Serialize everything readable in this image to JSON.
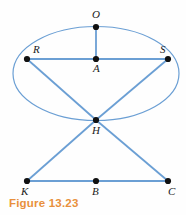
{
  "figure": {
    "caption": "Figure 13.23",
    "caption_color": "#e8903c",
    "stroke_color": "#6b9fd4",
    "point_color": "#111111",
    "background": "#fefefe",
    "width": 186,
    "height": 215
  },
  "points": [
    {
      "id": "O",
      "label": "O",
      "x": 96,
      "y": 27,
      "lx": 92,
      "ly": 18
    },
    {
      "id": "R",
      "label": "R",
      "x": 27,
      "y": 59,
      "lx": 33,
      "ly": 53
    },
    {
      "id": "S",
      "label": "S",
      "x": 168,
      "y": 59,
      "lx": 160,
      "ly": 53
    },
    {
      "id": "A",
      "label": "A",
      "x": 96,
      "y": 59,
      "lx": 93,
      "ly": 72
    },
    {
      "id": "H",
      "label": "H",
      "x": 96,
      "y": 120,
      "lx": 92,
      "ly": 134
    },
    {
      "id": "K",
      "label": "K",
      "x": 27,
      "y": 181,
      "lx": 21,
      "ly": 195
    },
    {
      "id": "B",
      "label": "B",
      "x": 96,
      "y": 181,
      "lx": 92,
      "ly": 195
    },
    {
      "id": "C",
      "label": "C",
      "x": 168,
      "y": 181,
      "lx": 168,
      "ly": 195
    }
  ],
  "ellipse": {
    "name": "base-ellipse",
    "cx": 96,
    "cy": 73.5,
    "rx": 83,
    "ry": 47
  },
  "segments": [
    {
      "name": "segment-O-A",
      "from": "O",
      "to": "A"
    },
    {
      "name": "segment-R-S",
      "from": "R",
      "to": "S"
    },
    {
      "name": "segment-R-H",
      "from": "R",
      "to": "H"
    },
    {
      "name": "segment-S-H",
      "from": "S",
      "to": "H"
    },
    {
      "name": "segment-H-K",
      "from": "H",
      "to": "K"
    },
    {
      "name": "segment-H-C",
      "from": "H",
      "to": "C"
    },
    {
      "name": "segment-K-C",
      "from": "K",
      "to": "C"
    }
  ]
}
